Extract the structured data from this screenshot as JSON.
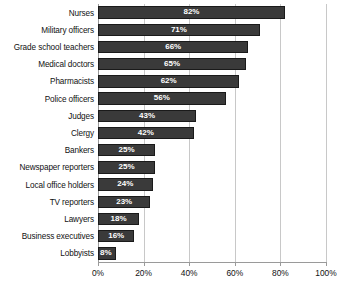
{
  "chart_data": {
    "type": "bar",
    "orientation": "horizontal",
    "title": "",
    "subtitle": "",
    "xlabel": "",
    "ylabel": "",
    "xlim": [
      0,
      100
    ],
    "grid": true,
    "legend": false,
    "legend_position": "none",
    "value_suffix": "%",
    "bar_color": "#3a3a3a",
    "bar_edge_color": "#1a1a1a",
    "value_label_color": "#ffffff",
    "gridline_color": "#c8c8c8",
    "axis_color": "#9a9a9a",
    "xticks": [
      0,
      20,
      40,
      60,
      80,
      100
    ],
    "xtick_labels": [
      "0%",
      "20%",
      "40%",
      "60%",
      "80%",
      "100%"
    ],
    "categories": [
      "Nurses",
      "Military officers",
      "Grade school teachers",
      "Medical doctors",
      "Pharmacists",
      "Police officers",
      "Judges",
      "Clergy",
      "Bankers",
      "Newspaper reporters",
      "Local office holders",
      "TV reporters",
      "Lawyers",
      "Business executives",
      "Lobbyists"
    ],
    "values": [
      82,
      71,
      66,
      65,
      62,
      56,
      43,
      42,
      25,
      25,
      24,
      23,
      18,
      16,
      8
    ],
    "data_labels": [
      "82%",
      "71%",
      "66%",
      "65%",
      "62%",
      "56%",
      "43%",
      "42%",
      "25%",
      "25%",
      "24%",
      "23%",
      "18%",
      "16%",
      "8%"
    ]
  }
}
